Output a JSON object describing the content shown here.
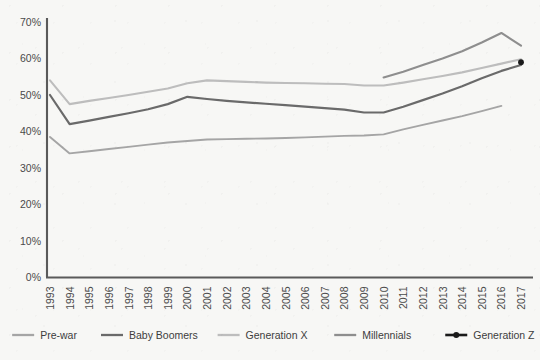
{
  "chart_data": {
    "type": "line",
    "title": "",
    "subtitle": "",
    "xlabel": "",
    "ylabel": "",
    "grid": false,
    "legend_position": "bottom",
    "x": [
      1993,
      1994,
      1995,
      1996,
      1997,
      1998,
      1999,
      2000,
      2001,
      2002,
      2003,
      2004,
      2005,
      2006,
      2007,
      2008,
      2009,
      2010,
      2011,
      2012,
      2013,
      2014,
      2015,
      2016,
      2017
    ],
    "xlim": [
      1993,
      2017
    ],
    "ylim": [
      0,
      70
    ],
    "ytick_labels": [
      "0%",
      "10%",
      "20%",
      "30%",
      "40%",
      "50%",
      "60%",
      "70%"
    ],
    "ytick_values": [
      0,
      10,
      20,
      30,
      40,
      50,
      60,
      70
    ],
    "xtick_labels": [
      "1993",
      "1994",
      "1995",
      "1996",
      "1997",
      "1998",
      "1999",
      "2000",
      "2001",
      "2002",
      "2003",
      "2004",
      "2005",
      "2006",
      "2007",
      "2008",
      "2009",
      "2010",
      "2011",
      "2012",
      "2013",
      "2014",
      "2015",
      "2016",
      "2017"
    ],
    "series": [
      {
        "name": "Pre-war",
        "color": "#a5a5a5",
        "width": 1.9,
        "marker": false,
        "x": [
          1993,
          1994,
          1995,
          1996,
          1997,
          1998,
          1999,
          2000,
          2001,
          2002,
          2003,
          2004,
          2005,
          2006,
          2007,
          2008,
          2009,
          2010,
          2011,
          2012,
          2013,
          2014,
          2015,
          2016
        ],
        "values": [
          38.5,
          34.0,
          34.6,
          35.2,
          35.8,
          36.4,
          37.0,
          37.4,
          37.8,
          37.9,
          38.0,
          38.1,
          38.2,
          38.4,
          38.6,
          38.8,
          38.9,
          39.2,
          40.6,
          41.8,
          43.0,
          44.2,
          45.6,
          47.0
        ]
      },
      {
        "name": "Baby Boomers",
        "color": "#6a6a6a",
        "width": 2.2,
        "marker": false,
        "x": [
          1993,
          1994,
          1995,
          1996,
          1997,
          1998,
          1999,
          2000,
          2001,
          2002,
          2003,
          2004,
          2005,
          2006,
          2007,
          2008,
          2009,
          2010,
          2011,
          2012,
          2013,
          2014,
          2015,
          2016,
          2017
        ],
        "values": [
          50.0,
          42.0,
          43.0,
          44.0,
          45.0,
          46.1,
          47.5,
          49.5,
          48.9,
          48.4,
          48.0,
          47.6,
          47.2,
          46.8,
          46.4,
          46.0,
          45.2,
          45.2,
          46.8,
          48.6,
          50.4,
          52.4,
          54.6,
          56.6,
          58.2
        ]
      },
      {
        "name": "Generation X",
        "color": "#bdbdbd",
        "width": 2.1,
        "marker": false,
        "x": [
          1993,
          1994,
          1995,
          1996,
          1997,
          1998,
          1999,
          2000,
          2001,
          2002,
          2003,
          2004,
          2005,
          2006,
          2007,
          2008,
          2009,
          2010,
          2011,
          2012,
          2013,
          2014,
          2015,
          2016,
          2017
        ],
        "values": [
          54.0,
          47.5,
          48.4,
          49.2,
          50.0,
          50.9,
          51.8,
          53.2,
          54.0,
          53.8,
          53.6,
          53.4,
          53.3,
          53.2,
          53.1,
          53.0,
          52.6,
          52.6,
          53.4,
          54.3,
          55.2,
          56.2,
          57.4,
          58.6,
          59.8
        ]
      },
      {
        "name": "Millennials",
        "color": "#8e8e8e",
        "width": 2.1,
        "marker": false,
        "x": [
          2010,
          2011,
          2012,
          2013,
          2014,
          2015,
          2016,
          2017
        ],
        "values": [
          54.8,
          56.4,
          58.2,
          60.0,
          62.0,
          64.4,
          67.0,
          63.5
        ]
      },
      {
        "name": "Generation Z",
        "color": "#1a1a1a",
        "width": 2.4,
        "marker": true,
        "x": [
          2017
        ],
        "values": [
          59.0
        ]
      }
    ]
  },
  "legend": {
    "items": [
      {
        "label": "Pre-war",
        "color": "#a5a5a5",
        "marker": false
      },
      {
        "label": "Baby Boomers",
        "color": "#6a6a6a",
        "marker": false
      },
      {
        "label": "Generation X",
        "color": "#bdbdbd",
        "marker": false
      },
      {
        "label": "Millennials",
        "color": "#8e8e8e",
        "marker": false
      },
      {
        "label": "Generation Z",
        "color": "#1a1a1a",
        "marker": true
      }
    ]
  },
  "axes": {
    "axis_color": "#5a5a5a",
    "background": "#f7f7f5"
  }
}
